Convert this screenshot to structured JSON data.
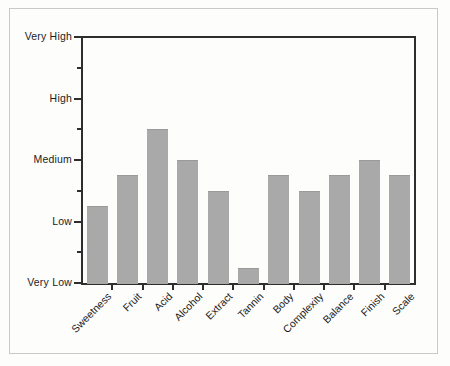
{
  "chart_data": {
    "type": "bar",
    "title": "",
    "subtitle": "",
    "xlabel": "",
    "ylabel": "",
    "categories": [
      "Sweetness",
      "Fruit",
      "Acid",
      "Alcohol",
      "Extract",
      "Tannin",
      "Body",
      "Complexity",
      "Balance",
      "Finish",
      "Scale"
    ],
    "values": [
      1.25,
      1.75,
      2.5,
      2.0,
      1.5,
      0.25,
      1.75,
      1.5,
      1.75,
      2.0,
      1.75
    ],
    "value_labels": [
      "Low-Medium",
      "Low-Medium",
      "Medium-High",
      "Medium",
      "Low-Medium",
      "Very Low",
      "Low-Medium",
      "Low-Medium",
      "Low-Medium",
      "Medium",
      "Low-Medium"
    ],
    "ytick_labels": [
      "Very Low",
      "Low",
      "Medium",
      "High",
      "Very High"
    ],
    "ytick_values": [
      0,
      1,
      2,
      3,
      4
    ],
    "yminor_values": [
      0.5,
      1.5,
      2.5,
      3.5
    ],
    "ylim": [
      0,
      4
    ],
    "grid": false,
    "legend": null,
    "legend_position": "none",
    "bar_color": "#a9a9a9",
    "axis_color": "#2e2e2e",
    "background_color": "#fdfdfc",
    "xlabel_rotation": -45
  },
  "figure": {
    "border_color": "#3a3a3a",
    "inner_border_color": "#c9c9c6"
  }
}
